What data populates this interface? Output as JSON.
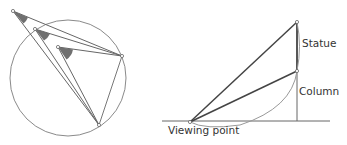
{
  "left_figure": {
    "description": "Inscribed angle diagram: three viewing points with shaded angles subtending the same chord of a circle",
    "circle": {
      "cx": 68,
      "cy": 78,
      "r": 58
    },
    "chord_endpoints": [
      {
        "x": 122,
        "y": 56
      },
      {
        "x": 99,
        "y": 125
      }
    ],
    "viewing_points": [
      {
        "x": 13,
        "y": 11
      },
      {
        "x": 35,
        "y": 29
      },
      {
        "x": 58,
        "y": 47
      }
    ],
    "angle_fill": "#707070"
  },
  "right_figure": {
    "labels": {
      "statue": "Statue",
      "column": "Column",
      "viewing_point": "Viewing point"
    },
    "ground_y": 121,
    "viewing_point": {
      "x": 190,
      "y": 122
    },
    "column_x": 297,
    "column_top_y": 71,
    "statue_top_y": 22
  },
  "colors": {
    "line": "#555555",
    "thin": "#888888",
    "text": "#333333"
  }
}
